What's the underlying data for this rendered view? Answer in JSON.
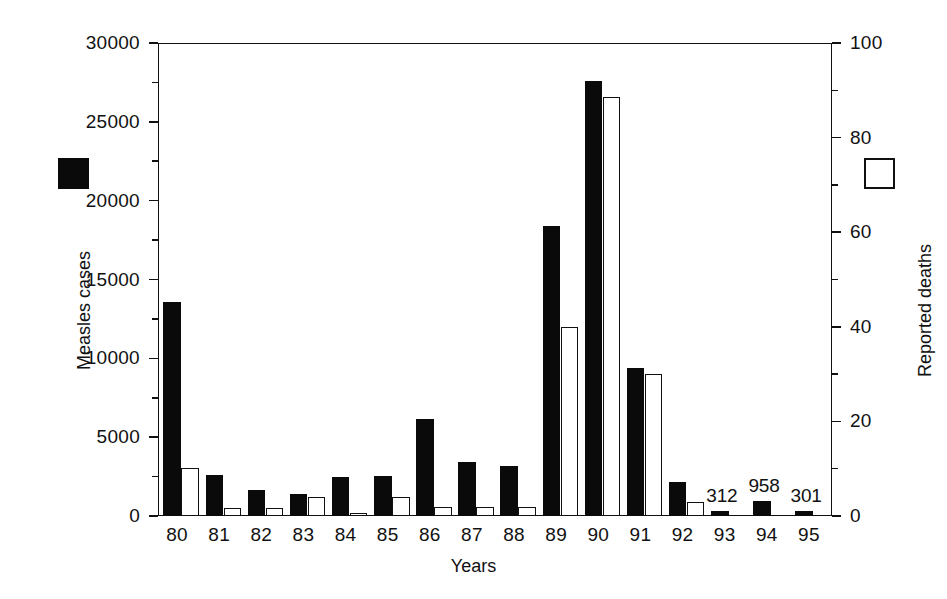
{
  "chart_data": {
    "type": "bar",
    "title": "",
    "xlabel": "Years",
    "ylabel": "Measles cases",
    "ylabel_secondary": "Reported deaths",
    "grid": false,
    "legend_position": "outside-left-and-right",
    "categories": [
      "80",
      "81",
      "82",
      "83",
      "84",
      "85",
      "86",
      "87",
      "88",
      "89",
      "90",
      "91",
      "92",
      "93",
      "94",
      "95"
    ],
    "ylim": [
      0,
      30000
    ],
    "ylim_secondary": [
      0,
      100
    ],
    "yticks": [
      0,
      5000,
      10000,
      15000,
      20000,
      25000,
      30000
    ],
    "ytick_labels": [
      "0",
      "5000",
      "10000",
      "15000",
      "20000",
      "25000",
      "30000"
    ],
    "yminor_step": 2500,
    "yticks_secondary": [
      0,
      20,
      40,
      60,
      80,
      100
    ],
    "ytick_labels_secondary": [
      "0",
      "20",
      "40",
      "60",
      "80",
      "100"
    ],
    "yminor_step_secondary": 10,
    "series": [
      {
        "name": "Measles cases",
        "axis": "left",
        "style": "filled-black",
        "color": "#0a0a0a",
        "values": [
          13600,
          2600,
          1650,
          1400,
          2500,
          2550,
          6150,
          3450,
          3200,
          18400,
          27600,
          9400,
          2150,
          312,
          958,
          301
        ]
      },
      {
        "name": "Reported deaths",
        "axis": "right",
        "style": "open-white",
        "color": "#ffffff",
        "values": [
          10.2,
          1.8,
          1.7,
          4.0,
          0.6,
          4.1,
          2.0,
          1.9,
          2.0,
          40.0,
          88.5,
          30.0,
          3.0,
          0,
          0,
          0
        ]
      }
    ],
    "point_labels": [
      {
        "category": "93",
        "text": "312"
      },
      {
        "category": "94",
        "text": "958"
      },
      {
        "category": "95",
        "text": "301"
      }
    ]
  },
  "legend": {
    "cases_swatch": "black-filled-square",
    "deaths_swatch": "white-open-square"
  }
}
